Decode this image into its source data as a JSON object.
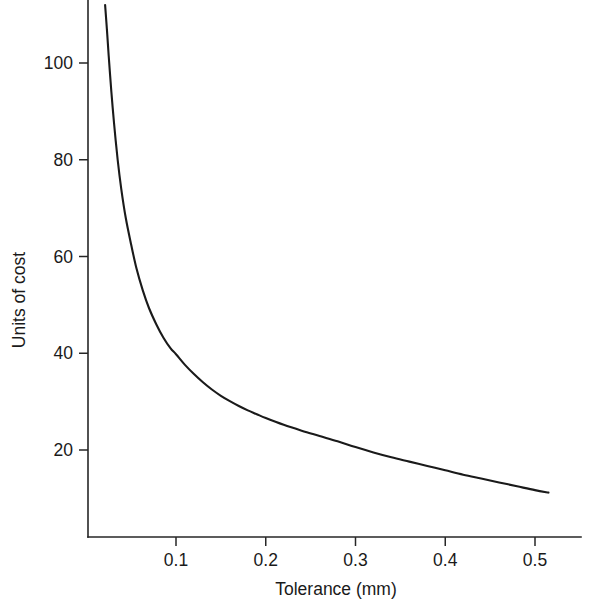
{
  "chart_data": {
    "type": "line",
    "title": "",
    "subtitle": "",
    "xlabel": "Tolerance (mm)",
    "ylabel": "Units of cost",
    "xlim": [
      0.0,
      0.545
    ],
    "ylim": [
      0.0,
      112.0
    ],
    "grid": false,
    "legend": null,
    "x_ticks": [
      0.1,
      0.2,
      0.3,
      0.4,
      0.5
    ],
    "x_tick_labels": [
      "0.1",
      "0.2",
      "0.3",
      "0.4",
      "0.5"
    ],
    "y_ticks": [
      20,
      40,
      60,
      80,
      100
    ],
    "y_tick_labels": [
      "20",
      "40",
      "60",
      "80",
      "100"
    ],
    "series": [
      {
        "name": "cost vs tolerance",
        "color": "#1a1a1a",
        "x": [
          0.021,
          0.023,
          0.025,
          0.028,
          0.031,
          0.035,
          0.039,
          0.044,
          0.05,
          0.056,
          0.063,
          0.07,
          0.078,
          0.086,
          0.094,
          0.1,
          0.11,
          0.12,
          0.13,
          0.14,
          0.15,
          0.16,
          0.17,
          0.18,
          0.19,
          0.2,
          0.22,
          0.24,
          0.26,
          0.28,
          0.3,
          0.32,
          0.34,
          0.36,
          0.38,
          0.4,
          0.42,
          0.44,
          0.46,
          0.48,
          0.5,
          0.515
        ],
        "y": [
          112.0,
          107.0,
          101.5,
          94.0,
          87.5,
          80.0,
          74.0,
          68.0,
          62.5,
          57.5,
          53.0,
          49.3,
          46.0,
          43.2,
          41.0,
          39.8,
          37.6,
          35.7,
          34.0,
          32.5,
          31.2,
          30.1,
          29.1,
          28.2,
          27.4,
          26.6,
          25.2,
          24.0,
          22.9,
          21.8,
          20.6,
          19.5,
          18.5,
          17.6,
          16.7,
          15.8,
          14.9,
          14.1,
          13.3,
          12.5,
          11.7,
          11.2
        ]
      }
    ],
    "annotations": []
  },
  "figure": {
    "background_color": "#ffffff",
    "axis_color": "#262626",
    "text_color": "#1a1a1a"
  }
}
